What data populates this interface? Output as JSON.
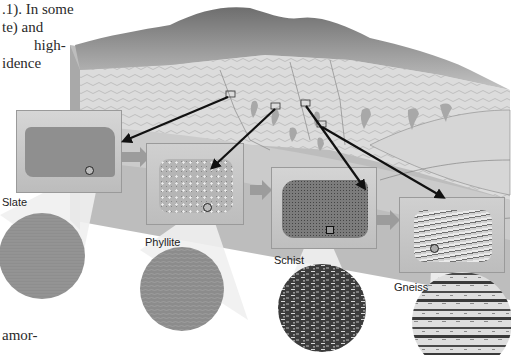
{
  "text_fragments": {
    "line1": ".1). In some",
    "line2": "te) and",
    "line3": "high-",
    "line4": "idence",
    "bottom": "amor-"
  },
  "rocks": [
    {
      "name": "Slate",
      "texture": "fine-uniform"
    },
    {
      "name": "Phyllite",
      "texture": "fine-wavy"
    },
    {
      "name": "Schist",
      "texture": "coarse-foliated"
    },
    {
      "name": "Gneiss",
      "texture": "banded"
    }
  ],
  "colors": {
    "background": "#ffffff",
    "block_top": "#d8d8d8",
    "block_side": "#a8a8a8",
    "panel_bg": "#c9c9c9",
    "arrow_gray": "#9c9c9c",
    "arrow_black": "#111111",
    "lens_gray": "#8d8d8d"
  }
}
